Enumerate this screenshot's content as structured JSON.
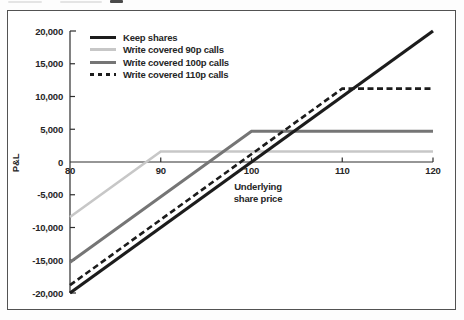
{
  "chart_data": {
    "type": "line",
    "title": "",
    "xlabel": "Underlying share price",
    "ylabel": "P&L",
    "xlim": [
      80,
      120
    ],
    "ylim": [
      -20000,
      20000
    ],
    "grid": false,
    "legend_position": "upper-left-inside",
    "x_ticks": [
      80,
      90,
      100,
      110,
      120
    ],
    "x_tick_labels": [
      "80",
      "90",
      "100",
      "110",
      "120"
    ],
    "y_ticks": [
      20000,
      15000,
      10000,
      5000,
      0,
      -5000,
      -10000,
      -15000,
      -20000
    ],
    "y_tick_labels": [
      "20,000",
      "15,000",
      "10,000",
      "5,000",
      "0",
      "-5,000",
      "-10,000",
      "-15,000",
      "-20,000"
    ],
    "series": [
      {
        "name": "Keep shares",
        "color": "#1c1c1c",
        "width": 3.2,
        "dash": null,
        "points": [
          [
            80,
            -20000
          ],
          [
            120,
            20000
          ]
        ]
      },
      {
        "name": "Write covered 90p calls",
        "color": "#c7c7c7",
        "width": 2.6,
        "dash": null,
        "points": [
          [
            80,
            -8400
          ],
          [
            90,
            1600
          ],
          [
            120,
            1600
          ]
        ]
      },
      {
        "name": "Write covered 100p calls",
        "color": "#757575",
        "width": 3,
        "dash": null,
        "points": [
          [
            80,
            -15300
          ],
          [
            100,
            4700
          ],
          [
            120,
            4700
          ]
        ]
      },
      {
        "name": "Write covered 110p calls",
        "color": "#1c1c1c",
        "width": 2.6,
        "dash": "6 3.5",
        "points": [
          [
            80,
            -18800
          ],
          [
            110,
            11200
          ],
          [
            120,
            11200
          ]
        ]
      }
    ],
    "axis_color": "#2e2e2e",
    "text_color": "#262626"
  }
}
